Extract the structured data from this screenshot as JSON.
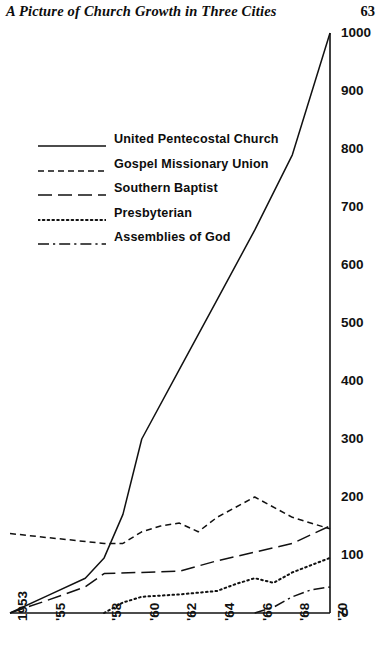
{
  "header": {
    "title": "A Picture of Church Growth in Three Cities",
    "page_number": "63"
  },
  "chart_data": {
    "type": "line",
    "title": "A Picture of Church Growth in Three Cities",
    "xlabel": "",
    "ylabel": "",
    "grid": false,
    "legend_position": "upper-left-inside",
    "xlim": [
      1953,
      1970
    ],
    "ylim": [
      0,
      1000
    ],
    "x": [
      1953,
      1955,
      1958,
      1960,
      1962,
      1964,
      1966,
      1968,
      1970
    ],
    "x_tick_labels": [
      "1953",
      "'55",
      "'58",
      "'60",
      "'62",
      "'64",
      "'66",
      "'68",
      "'70"
    ],
    "y_tick_labels": [
      "0",
      "100",
      "200",
      "300",
      "400",
      "500",
      "600",
      "700",
      "800",
      "900",
      "1000"
    ],
    "y_tick_values": [
      0,
      100,
      200,
      300,
      400,
      500,
      600,
      700,
      800,
      900,
      1000
    ],
    "series": [
      {
        "name": "United Pentecostal Church",
        "line_style": "solid",
        "x": [
          1953,
          1955,
          1957,
          1958,
          1959,
          1960,
          1962,
          1964,
          1966,
          1968,
          1970
        ],
        "values": [
          0,
          30,
          60,
          95,
          170,
          300,
          420,
          540,
          660,
          790,
          1000
        ]
      },
      {
        "name": "Gospel Missionary Union",
        "line_style": "dashed",
        "x": [
          1953,
          1955,
          1958,
          1959,
          1960,
          1961,
          1962,
          1963,
          1964,
          1966,
          1968,
          1970
        ],
        "values": [
          137,
          130,
          120,
          120,
          140,
          150,
          155,
          140,
          165,
          200,
          165,
          145
        ]
      },
      {
        "name": "Southern Baptist",
        "line_style": "long-dash",
        "x": [
          1953,
          1955,
          1957,
          1958,
          1960,
          1962,
          1964,
          1966,
          1968,
          1970
        ],
        "values": [
          0,
          22,
          45,
          68,
          70,
          72,
          90,
          105,
          120,
          150
        ]
      },
      {
        "name": "Presbyterian",
        "line_style": "dotted",
        "x": [
          1958,
          1959,
          1960,
          1962,
          1964,
          1965,
          1966,
          1967,
          1968,
          1970
        ],
        "values": [
          0,
          18,
          28,
          32,
          38,
          50,
          60,
          52,
          70,
          95
        ]
      },
      {
        "name": "Assemblies of God",
        "line_style": "dash-dot",
        "x": [
          1966,
          1967,
          1968,
          1969,
          1970
        ],
        "values": [
          0,
          10,
          28,
          40,
          45
        ]
      }
    ]
  },
  "legend": {
    "items": [
      {
        "label": "United Pentecostal Church",
        "style": "solid"
      },
      {
        "label": "Gospel Missionary Union",
        "style": "dashed"
      },
      {
        "label": "Southern Baptist",
        "style": "long-dash"
      },
      {
        "label": "Presbyterian",
        "style": "dotted"
      },
      {
        "label": "Assemblies of God",
        "style": "dash-dot"
      }
    ]
  },
  "axes": {
    "y_labels": [
      "1000",
      "900",
      "800",
      "700",
      "600",
      "500",
      "400",
      "300",
      "200",
      "100",
      "0"
    ],
    "x_labels": [
      "1953",
      "'55",
      "'58",
      "'60",
      "'62",
      "'64",
      "'66",
      "'68",
      "'70"
    ]
  },
  "colors": {
    "ink": "#111111",
    "background": "#ffffff"
  }
}
